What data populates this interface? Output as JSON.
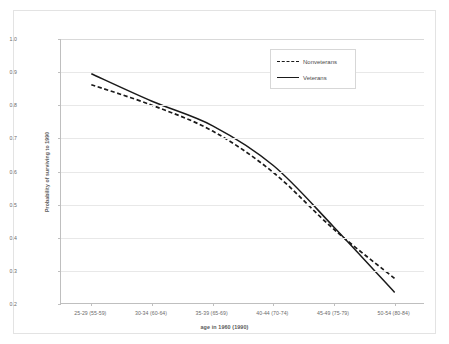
{
  "chart_data": {
    "type": "line",
    "title": "",
    "xlabel": "age in 1960 (1990)",
    "ylabel": "Probability of surviving to 1990",
    "categories": [
      "25-29 (55-59)",
      "30-34 (60-64)",
      "35-39 (65-69)",
      "40-44 (70-74)",
      "45-49 (75-79)",
      "50-54 (80-84)"
    ],
    "series": [
      {
        "name": "Nonveterans",
        "style": "dashed",
        "color": "#1a1a1a",
        "values": [
          0.862,
          0.8,
          0.722,
          0.597,
          0.425,
          0.277
        ]
      },
      {
        "name": "Veterans",
        "style": "solid",
        "color": "#1a1a1a",
        "values": [
          0.895,
          0.812,
          0.738,
          0.618,
          0.432,
          0.235
        ]
      }
    ],
    "ylim": [
      0.2,
      1.0
    ],
    "ytick_labels": [
      "1.0",
      "0.9",
      "0.8",
      "0.7",
      "0.6",
      "0.5",
      "0.4",
      "0.3",
      "0.2"
    ],
    "ytick_values": [
      1.0,
      0.9,
      0.8,
      0.7,
      0.6,
      0.5,
      0.4,
      0.3,
      0.2
    ],
    "grid": "horizontal",
    "legend_position": "top-right",
    "annotations": []
  },
  "legend": {
    "entries": [
      {
        "label": "Nonveterans"
      },
      {
        "label": "Veterans"
      }
    ]
  }
}
